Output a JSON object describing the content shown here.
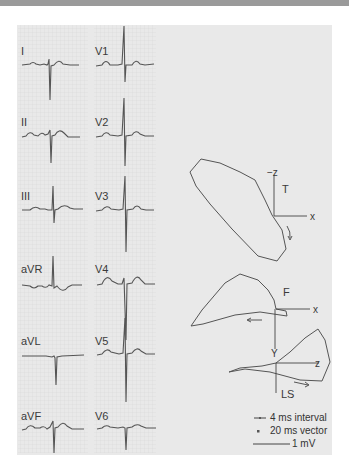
{
  "figure": {
    "ecg": {
      "left_column": [
        {
          "lead": "I"
        },
        {
          "lead": "II"
        },
        {
          "lead": "III"
        },
        {
          "lead": "aVR"
        },
        {
          "lead": "aVL"
        },
        {
          "lead": "aVF"
        }
      ],
      "right_column": [
        {
          "lead": "V1"
        },
        {
          "lead": "V2"
        },
        {
          "lead": "V3"
        },
        {
          "lead": "V4"
        },
        {
          "lead": "V5"
        },
        {
          "lead": "V6"
        }
      ]
    },
    "vectorcardiogram": {
      "transverse": {
        "plane_label": "T",
        "axis_x": "x",
        "axis_vertical": "−z"
      },
      "frontal": {
        "plane_label": "F",
        "axis_x": "x",
        "axis_vertical": "Y"
      },
      "left_sagittal": {
        "plane_label": "LS",
        "axis_x": "z"
      }
    },
    "legend": {
      "items": [
        {
          "symbol": "dash-dot",
          "text": "4 ms interval"
        },
        {
          "symbol": "dot",
          "text": "20 ms vector"
        },
        {
          "symbol": "line",
          "text": "1 mV"
        }
      ]
    },
    "colors": {
      "panel_bg": "#e9e9e9",
      "trace": "#555555",
      "grid": "#cfcfcf"
    }
  }
}
